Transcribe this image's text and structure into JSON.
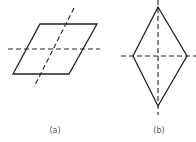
{
  "figures": [
    {
      "id": "a",
      "label": "(a)",
      "shape": "parallelogram",
      "points": "40,24 97,24 69,74 13,74",
      "axes": [
        {
          "x1": 8,
          "y1": 49,
          "x2": 100,
          "y2": 49
        },
        {
          "x1": 74,
          "y1": 8,
          "x2": 34,
          "y2": 87
        }
      ],
      "label_pos": {
        "x": 55,
        "y": 126
      }
    },
    {
      "id": "b",
      "label": "(b)",
      "shape": "rhombus",
      "points": "158,7 187,56 158,106 133,56",
      "axes": [
        {
          "x1": 121,
          "y1": 56,
          "x2": 196,
          "y2": 56
        },
        {
          "x1": 158,
          "y1": 0,
          "x2": 158,
          "y2": 115
        }
      ],
      "label_pos": {
        "x": 159,
        "y": 126
      }
    }
  ],
  "colors": {
    "stroke": "#222222",
    "label": "#555555"
  }
}
